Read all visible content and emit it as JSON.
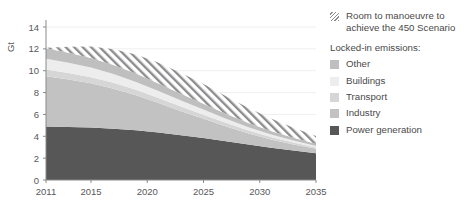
{
  "chart_data": {
    "type": "area",
    "title": "",
    "xlabel": "",
    "ylabel": "Gt",
    "x": [
      2011,
      2015,
      2020,
      2025,
      2030,
      2035
    ],
    "x_ticks": [
      "2011",
      "2015",
      "2020",
      "2025",
      "2030",
      "2035"
    ],
    "xlim": [
      2011,
      2035
    ],
    "ylim": [
      0,
      14
    ],
    "y_ticks": [
      "0",
      "2",
      "4",
      "6",
      "8",
      "10",
      "12",
      "14"
    ],
    "y_tick_values": [
      0,
      2,
      4,
      6,
      8,
      10,
      12,
      14
    ],
    "grid": true,
    "legend_position": "right",
    "stacked": true,
    "series": [
      {
        "name": "Power generation",
        "color": "#575757",
        "x": [
          2011,
          2013,
          2015,
          2017,
          2019,
          2021,
          2023,
          2025,
          2027,
          2029,
          2031,
          2033,
          2035
        ],
        "values": [
          4.9,
          4.85,
          4.8,
          4.7,
          4.55,
          4.35,
          4.1,
          3.85,
          3.55,
          3.25,
          2.95,
          2.7,
          2.45
        ]
      },
      {
        "name": "Industry",
        "color": "#c2c2c2",
        "x": [
          2011,
          2013,
          2015,
          2017,
          2019,
          2021,
          2023,
          2025,
          2027,
          2029,
          2031,
          2033,
          2035
        ],
        "values": [
          4.6,
          4.35,
          4.05,
          3.65,
          3.2,
          2.7,
          2.2,
          1.75,
          1.35,
          1.0,
          0.75,
          0.55,
          0.4
        ]
      },
      {
        "name": "Transport",
        "color": "#d6d6d6",
        "x": [
          2011,
          2013,
          2015,
          2017,
          2019,
          2021,
          2023,
          2025,
          2027,
          2029,
          2031,
          2033,
          2035
        ],
        "values": [
          0.6,
          0.58,
          0.56,
          0.54,
          0.5,
          0.46,
          0.42,
          0.38,
          0.33,
          0.28,
          0.23,
          0.18,
          0.13
        ]
      },
      {
        "name": "Buildings",
        "color": "#ededed",
        "x": [
          2011,
          2013,
          2015,
          2017,
          2019,
          2021,
          2023,
          2025,
          2027,
          2029,
          2031,
          2033,
          2035
        ],
        "values": [
          1.0,
          0.95,
          0.88,
          0.8,
          0.72,
          0.63,
          0.55,
          0.46,
          0.38,
          0.3,
          0.24,
          0.18,
          0.13
        ]
      },
      {
        "name": "Other",
        "color": "#bfbfbf",
        "x": [
          2011,
          2013,
          2015,
          2017,
          2019,
          2021,
          2023,
          2025,
          2027,
          2029,
          2031,
          2033,
          2035
        ],
        "values": [
          0.95,
          0.92,
          0.88,
          0.83,
          0.77,
          0.7,
          0.62,
          0.54,
          0.46,
          0.38,
          0.31,
          0.25,
          0.2
        ]
      },
      {
        "name": "Room to manoeuvre to achieve the 450 Scenario",
        "color": "hatch",
        "x": [
          2011,
          2013,
          2015,
          2017,
          2019,
          2021,
          2023,
          2025,
          2027,
          2029,
          2031,
          2033,
          2035
        ],
        "values": [
          0.05,
          0.55,
          1.05,
          1.45,
          1.75,
          1.9,
          1.9,
          1.8,
          1.6,
          1.38,
          1.15,
          0.92,
          0.72
        ]
      }
    ]
  },
  "axis": {
    "y_title": "Gt"
  },
  "legend": {
    "hatch_entry": "Room to manoeuvre to\nachieve the 450 Scenario",
    "heading": "Locked-in emissions:",
    "items": [
      {
        "label": "Other",
        "color": "#bfbfbf"
      },
      {
        "label": "Buildings",
        "color": "#ededed"
      },
      {
        "label": "Transport",
        "color": "#d6d6d6"
      },
      {
        "label": "Industry",
        "color": "#c2c2c2"
      },
      {
        "label": "Power generation",
        "color": "#575757"
      }
    ]
  }
}
